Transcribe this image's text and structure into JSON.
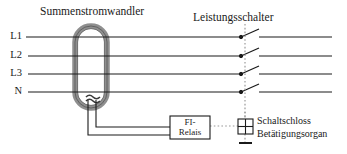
{
  "diagram": {
    "title_left": "Summenstromwandler",
    "title_right": "Leistungsschalter",
    "phases": [
      {
        "name": "L1"
      },
      {
        "name": "L2"
      },
      {
        "name": "L3"
      },
      {
        "name": "N"
      }
    ],
    "relay_box": {
      "line1": "FI-",
      "line2": "Relais"
    },
    "actuator": {
      "line1": "Schaltschloss",
      "line2": "Betätigungsorgan"
    },
    "colors": {
      "line": "#1a1a1a",
      "core": "#9a9a9a",
      "core_edge": "#4a4a4a",
      "trip_dotted": "#9a9a9a",
      "background": "#ffffff"
    }
  }
}
